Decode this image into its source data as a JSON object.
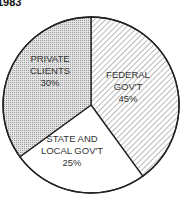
{
  "chart_data": {
    "type": "pie",
    "title": "1983",
    "slices": [
      {
        "label_lines": [
          "FEDERAL",
          "GOV'T"
        ],
        "label": "FEDERAL GOV'T",
        "value": 45,
        "value_label": "45%",
        "pattern": "diagonal-hatch"
      },
      {
        "label_lines": [
          "STATE AND",
          "LOCAL GOV'T"
        ],
        "label": "STATE AND LOCAL GOV'T",
        "value": 25,
        "value_label": "25%",
        "pattern": "none"
      },
      {
        "label_lines": [
          "PRIVATE",
          "CLIENTS"
        ],
        "label": "PRIVATE CLIENTS",
        "value": 30,
        "value_label": "30%",
        "pattern": "dots"
      }
    ],
    "start_angle": "12 o'clock",
    "direction": "clockwise",
    "legend": "none"
  }
}
